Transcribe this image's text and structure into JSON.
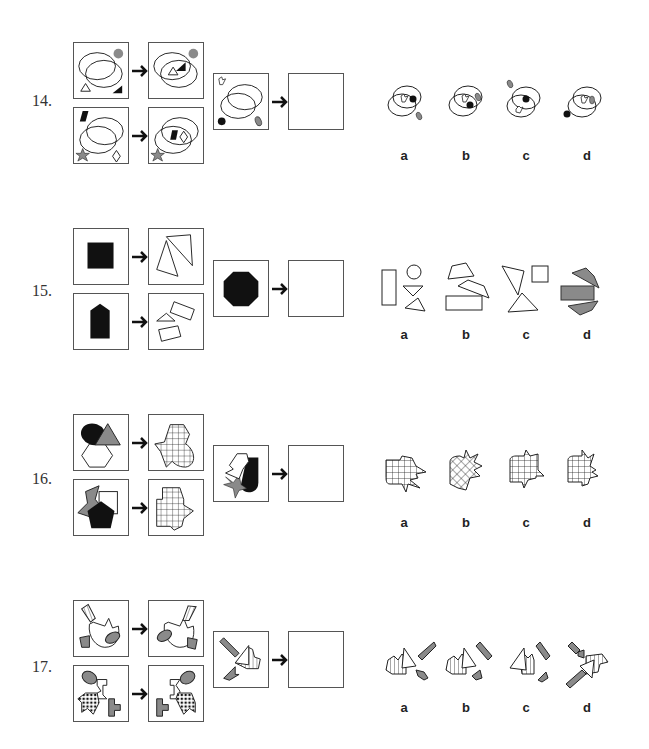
{
  "problems": [
    {
      "number": "14.",
      "description": "Overlapping ellipses: outside shapes move into the intersection region",
      "option_labels": [
        "a",
        "b",
        "c",
        "d"
      ]
    },
    {
      "number": "15.",
      "description": "Black solid shape decomposes into outlined pieces",
      "option_labels": [
        "a",
        "b",
        "c",
        "d"
      ]
    },
    {
      "number": "16.",
      "description": "Overlapping shapes merge into single grid-filled silhouette",
      "option_labels": [
        "a",
        "b",
        "c",
        "d"
      ]
    },
    {
      "number": "17.",
      "description": "Outer shapes rotate/reflect around central figure",
      "option_labels": [
        "a",
        "b",
        "c",
        "d"
      ]
    }
  ],
  "colors": {
    "border": "#555555",
    "black_fill": "#111111",
    "gray_fill": "#8a8a8a",
    "text": "#333333"
  }
}
